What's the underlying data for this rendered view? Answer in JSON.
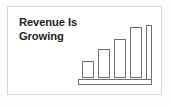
{
  "card": {
    "background_color": "#ffffff",
    "border_color": "#d8d8d8"
  },
  "headline": {
    "line1": "Revenue Is",
    "line2": "Growing",
    "color": "#1d1d1f"
  },
  "chart_data": {
    "type": "bar",
    "title": "Revenue Is Growing",
    "xlabel": "",
    "ylabel": "",
    "categories": [
      "1",
      "2",
      "3",
      "4"
    ],
    "values": [
      28,
      48,
      66,
      86
    ],
    "ylim": [
      0,
      100
    ],
    "grid": false,
    "legend": false,
    "style": {
      "bar_fill": "#ffffff",
      "bar_stroke": "#6e6e6e",
      "axis_stroke": "#6e6e6e",
      "stroke_width": 1
    },
    "axes": {
      "vertical_axis_position": "right",
      "baseline_style": "outlined-rectangle"
    }
  }
}
